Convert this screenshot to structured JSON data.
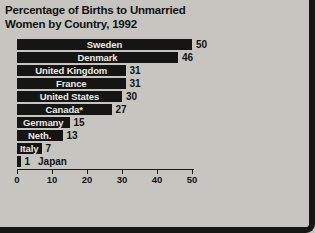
{
  "chart": {
    "title_line1": "Percentage of Births to Unmarried",
    "title_line2": "Women by Country, 1992"
  },
  "chart_data": {
    "type": "bar",
    "orientation": "horizontal",
    "title": "Percentage of Births to Unmarried Women by Country, 1992",
    "categories": [
      "Sweden",
      "Denmark",
      "United Kingdom",
      "France",
      "United States",
      "Canada*",
      "Germany",
      "Neth.",
      "Italy",
      "Japan"
    ],
    "values": [
      50,
      46,
      31,
      31,
      30,
      27,
      15,
      13,
      7,
      1
    ],
    "xlabel": "",
    "ylabel": "",
    "xlim": [
      0,
      50
    ],
    "xticks": [
      0,
      10,
      20,
      30,
      40,
      50
    ],
    "legend": "none",
    "grid": false,
    "bar_color": "#151513",
    "bar_label_color": "#eceae4",
    "text_color": "#131312",
    "background_color": "#c7c5c0"
  }
}
